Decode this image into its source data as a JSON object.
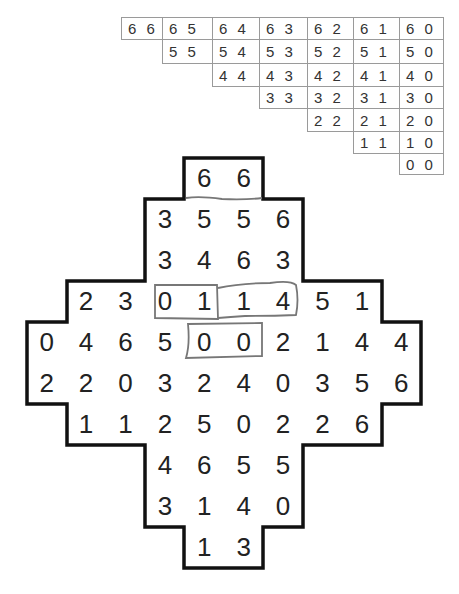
{
  "reference_table": {
    "rows": [
      [
        "6 6",
        "6 5",
        "6 4",
        "6 3",
        "6 2",
        "6 1",
        "6 0"
      ],
      [
        "5 5",
        "5 4",
        "5 3",
        "5 2",
        "5 1",
        "5 0"
      ],
      [
        "4 4",
        "4 3",
        "4 2",
        "4 1",
        "4 0"
      ],
      [
        "3 3",
        "3 2",
        "3 1",
        "3 0"
      ],
      [
        "2 2",
        "2 1",
        "2 0"
      ],
      [
        "1 1",
        "1 0"
      ],
      [
        "0 0"
      ]
    ]
  },
  "grid": {
    "rows": [
      {
        "start": 4,
        "values": [
          "6",
          "6"
        ]
      },
      {
        "start": 3,
        "values": [
          "3",
          "5",
          "5",
          "6"
        ]
      },
      {
        "start": 3,
        "values": [
          "3",
          "4",
          "6",
          "3"
        ]
      },
      {
        "start": 1,
        "values": [
          "2",
          "3",
          "0",
          "1",
          "1",
          "4",
          "5",
          "1"
        ]
      },
      {
        "start": 0,
        "values": [
          "0",
          "4",
          "6",
          "5",
          "0",
          "0",
          "2",
          "1",
          "4",
          "4"
        ]
      },
      {
        "start": 0,
        "values": [
          "2",
          "2",
          "0",
          "3",
          "2",
          "4",
          "0",
          "3",
          "5",
          "6"
        ]
      },
      {
        "start": 1,
        "values": [
          "1",
          "1",
          "2",
          "5",
          "0",
          "2",
          "2",
          "6"
        ]
      },
      {
        "start": 3,
        "values": [
          "4",
          "6",
          "5",
          "5"
        ]
      },
      {
        "start": 3,
        "values": [
          "3",
          "1",
          "4",
          "0"
        ]
      },
      {
        "start": 4,
        "values": [
          "1",
          "3"
        ]
      }
    ],
    "marked_dominoes": [
      {
        "row": 0,
        "cols": [
          4,
          5
        ],
        "values": "6-6"
      },
      {
        "row": 3,
        "cols": [
          3,
          4
        ],
        "values": "0-1"
      },
      {
        "row": 3,
        "cols": [
          5,
          6
        ],
        "values": "1-4"
      },
      {
        "row": 4,
        "cols": [
          4,
          5
        ],
        "values": "0-0"
      }
    ]
  },
  "colors": {
    "outline": "#111111",
    "domino_mark": "#777777",
    "table_border": "#9a9a9a",
    "text": "#222222"
  }
}
